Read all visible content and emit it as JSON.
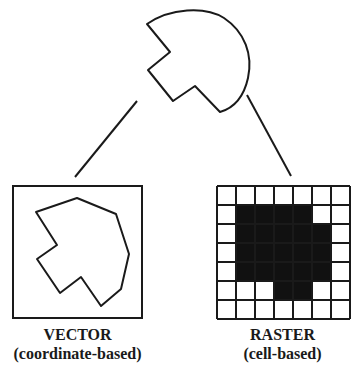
{
  "diagram": {
    "source_shape": {
      "description": "original real-world feature shape"
    },
    "vector": {
      "title": "VECTOR",
      "subtitle": "(coordinate-based)"
    },
    "raster": {
      "title": "RASTER",
      "subtitle": "(cell-based)",
      "grid_rows": 7,
      "grid_cols": 7,
      "cells": [
        [
          0,
          0,
          0,
          0,
          0,
          0,
          0
        ],
        [
          0,
          1,
          1,
          1,
          1,
          0,
          0
        ],
        [
          0,
          1,
          1,
          1,
          1,
          1,
          0
        ],
        [
          0,
          1,
          1,
          1,
          1,
          1,
          0
        ],
        [
          0,
          1,
          1,
          1,
          1,
          1,
          0
        ],
        [
          0,
          0,
          0,
          1,
          1,
          0,
          0
        ],
        [
          0,
          0,
          0,
          0,
          0,
          0,
          0
        ]
      ]
    },
    "colors": {
      "stroke": "#1a1a1a",
      "fill": "#111111",
      "background": "#ffffff"
    }
  }
}
